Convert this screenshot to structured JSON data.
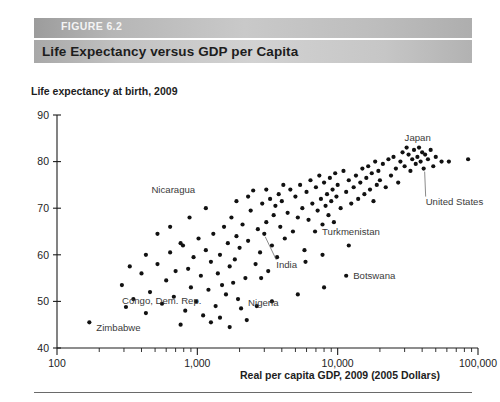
{
  "figure": {
    "number_label": "FIGURE 6.2",
    "title": "Life Expectancy versus GDP per Capita"
  },
  "chart_data": {
    "type": "scatter",
    "title": "Life Expectancy versus GDP per Capita",
    "xlabel": "Real per capita GDP, 2009 (2005 Dollars)",
    "ylabel": "Life expectancy at birth, 2009",
    "xscale": "log",
    "yscale": "linear",
    "xlim": [
      100,
      100000
    ],
    "ylim": [
      40,
      90
    ],
    "xticks": [
      100,
      1000,
      10000,
      100000
    ],
    "xtick_labels": [
      "100",
      "1,000",
      "10,000",
      "100,000"
    ],
    "yticks": [
      40,
      50,
      60,
      70,
      80,
      90
    ],
    "ytick_labels": [
      "40",
      "50",
      "60",
      "70",
      "80",
      "90"
    ],
    "grid": false,
    "legend": "none",
    "marker_color": "#111111",
    "annotations": [
      {
        "label": "Zimbabwe",
        "x": 170,
        "y": 45.5,
        "text_dx": 7,
        "text_dy": 9,
        "leader": false
      },
      {
        "label": "Congo, Dem. Rep.",
        "x": 310,
        "y": 48.8,
        "text_dx": -4,
        "text_dy": -3,
        "leader": false
      },
      {
        "label": "Nigeria",
        "x": 2050,
        "y": 48.5,
        "text_dx": 7,
        "text_dy": -2,
        "leader": false
      },
      {
        "label": "Nicaragua",
        "x": 2500,
        "y": 73.8,
        "text_dx": -58,
        "text_dy": 3,
        "leader": false
      },
      {
        "label": "India",
        "x": 3000,
        "y": 64.5,
        "text_dx": 12,
        "text_dy": 34,
        "leader": true
      },
      {
        "label": "Turkmenistan",
        "x": 6900,
        "y": 65.0,
        "text_dx": 7,
        "text_dy": 3,
        "leader": false
      },
      {
        "label": "Botswana",
        "x": 11500,
        "y": 55.5,
        "text_dx": 7,
        "text_dy": 3,
        "leader": false
      },
      {
        "label": "Japan",
        "x": 31000,
        "y": 83.0,
        "text_dx": -2,
        "text_dy": -7,
        "leader": false
      },
      {
        "label": "United States",
        "x": 41000,
        "y": 78.5,
        "text_dx": 2,
        "text_dy": 36,
        "leader": true
      }
    ],
    "points": [
      [
        170,
        45.5
      ],
      [
        310,
        48.8
      ],
      [
        290,
        53.5
      ],
      [
        350,
        50.5
      ],
      [
        400,
        56.0
      ],
      [
        430,
        47.5
      ],
      [
        460,
        52.0
      ],
      [
        520,
        58.0
      ],
      [
        560,
        49.5
      ],
      [
        600,
        54.5
      ],
      [
        640,
        60.5
      ],
      [
        680,
        51.0
      ],
      [
        700,
        56.5
      ],
      [
        760,
        45.0
      ],
      [
        790,
        62.0
      ],
      [
        820,
        48.0
      ],
      [
        860,
        57.0
      ],
      [
        900,
        53.0
      ],
      [
        940,
        59.5
      ],
      [
        980,
        50.0
      ],
      [
        1020,
        63.5
      ],
      [
        1060,
        55.5
      ],
      [
        1100,
        47.0
      ],
      [
        1150,
        61.0
      ],
      [
        1200,
        52.5
      ],
      [
        1250,
        58.5
      ],
      [
        1300,
        64.5
      ],
      [
        1350,
        49.0
      ],
      [
        1400,
        56.0
      ],
      [
        1450,
        60.0
      ],
      [
        1500,
        53.5
      ],
      [
        1550,
        66.0
      ],
      [
        1600,
        51.5
      ],
      [
        1650,
        62.5
      ],
      [
        1700,
        57.5
      ],
      [
        1750,
        68.0
      ],
      [
        1800,
        54.0
      ],
      [
        1850,
        59.0
      ],
      [
        1900,
        64.0
      ],
      [
        1950,
        50.5
      ],
      [
        2000,
        61.5
      ],
      [
        2050,
        48.5
      ],
      [
        2100,
        66.5
      ],
      [
        2200,
        55.0
      ],
      [
        2300,
        63.0
      ],
      [
        2400,
        69.5
      ],
      [
        2500,
        73.8
      ],
      [
        2600,
        58.0
      ],
      [
        2700,
        65.5
      ],
      [
        2800,
        60.5
      ],
      [
        2900,
        71.0
      ],
      [
        3000,
        64.5
      ],
      [
        3100,
        67.0
      ],
      [
        3200,
        56.5
      ],
      [
        3300,
        72.0
      ],
      [
        3400,
        62.0
      ],
      [
        3500,
        68.5
      ],
      [
        3600,
        70.5
      ],
      [
        3700,
        59.5
      ],
      [
        3800,
        73.0
      ],
      [
        3900,
        66.0
      ],
      [
        4000,
        71.5
      ],
      [
        4200,
        63.5
      ],
      [
        4400,
        69.0
      ],
      [
        4600,
        74.0
      ],
      [
        4800,
        65.0
      ],
      [
        5000,
        72.5
      ],
      [
        5200,
        68.0
      ],
      [
        5400,
        75.0
      ],
      [
        5600,
        70.0
      ],
      [
        5800,
        61.0
      ],
      [
        6000,
        73.5
      ],
      [
        6200,
        67.5
      ],
      [
        6400,
        76.0
      ],
      [
        6600,
        71.0
      ],
      [
        6900,
        65.0
      ],
      [
        7000,
        74.5
      ],
      [
        7200,
        69.5
      ],
      [
        7400,
        77.0
      ],
      [
        7600,
        72.0
      ],
      [
        7800,
        66.5
      ],
      [
        8000,
        75.5
      ],
      [
        8200,
        70.5
      ],
      [
        8400,
        73.0
      ],
      [
        8600,
        68.5
      ],
      [
        8800,
        76.5
      ],
      [
        9000,
        71.5
      ],
      [
        9200,
        74.0
      ],
      [
        9400,
        67.0
      ],
      [
        9600,
        77.5
      ],
      [
        9800,
        72.5
      ],
      [
        10000,
        75.0
      ],
      [
        10500,
        70.0
      ],
      [
        11000,
        78.0
      ],
      [
        11500,
        55.5
      ],
      [
        11500,
        73.5
      ],
      [
        12000,
        76.0
      ],
      [
        12500,
        71.0
      ],
      [
        13000,
        74.5
      ],
      [
        13500,
        77.0
      ],
      [
        14000,
        72.0
      ],
      [
        14500,
        75.5
      ],
      [
        15000,
        78.5
      ],
      [
        15500,
        73.0
      ],
      [
        16000,
        76.5
      ],
      [
        16500,
        79.0
      ],
      [
        17000,
        74.0
      ],
      [
        17500,
        77.5
      ],
      [
        18000,
        71.5
      ],
      [
        18500,
        80.0
      ],
      [
        19000,
        75.0
      ],
      [
        19500,
        78.0
      ],
      [
        20000,
        76.0
      ],
      [
        21000,
        79.5
      ],
      [
        22000,
        74.5
      ],
      [
        23000,
        80.5
      ],
      [
        24000,
        77.0
      ],
      [
        25000,
        81.0
      ],
      [
        26000,
        78.5
      ],
      [
        27000,
        75.5
      ],
      [
        28000,
        80.0
      ],
      [
        29000,
        82.0
      ],
      [
        30000,
        79.0
      ],
      [
        31000,
        83.0
      ],
      [
        32000,
        81.5
      ],
      [
        33000,
        78.0
      ],
      [
        34000,
        80.5
      ],
      [
        35000,
        82.5
      ],
      [
        36000,
        79.5
      ],
      [
        37000,
        81.0
      ],
      [
        38000,
        83.0
      ],
      [
        39000,
        80.0
      ],
      [
        40000,
        82.0
      ],
      [
        41000,
        78.5
      ],
      [
        42000,
        81.5
      ],
      [
        44000,
        80.5
      ],
      [
        46000,
        82.5
      ],
      [
        48000,
        79.0
      ],
      [
        50000,
        81.0
      ],
      [
        55000,
        80.0
      ],
      [
        62000,
        80.0
      ],
      [
        85000,
        80.5
      ],
      [
        1250,
        45.5
      ],
      [
        1450,
        46.5
      ],
      [
        2650,
        49.0
      ],
      [
        3400,
        50.0
      ],
      [
        5200,
        51.5
      ],
      [
        8000,
        53.0
      ],
      [
        880,
        68.0
      ],
      [
        1150,
        70.0
      ],
      [
        1900,
        71.5
      ],
      [
        2300,
        72.5
      ],
      [
        3100,
        74.0
      ],
      [
        4100,
        75.0
      ],
      [
        520,
        64.5
      ],
      [
        640,
        66.0
      ],
      [
        760,
        62.5
      ],
      [
        430,
        60.0
      ],
      [
        330,
        57.5
      ],
      [
        5900,
        58.5
      ],
      [
        7800,
        60.0
      ],
      [
        12000,
        62.0
      ],
      [
        2850,
        55.0
      ],
      [
        1700,
        44.5
      ],
      [
        2250,
        46.0
      ]
    ]
  }
}
